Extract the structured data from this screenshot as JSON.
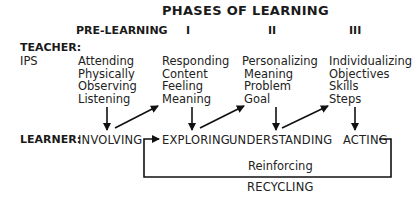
{
  "title": "PHASES OF LEARNING",
  "phases": [
    "PRE-LEARNING",
    "I",
    "II",
    "III"
  ],
  "teacher": {
    "label": "TEACHER:",
    "sublabel": "IPS",
    "columns": [
      [
        "Attending",
        "Physically",
        "Observing",
        "Listening"
      ],
      [
        "Responding",
        "Content",
        "Feeling",
        "Meaning"
      ],
      [
        "Personalizing",
        "Meaning",
        "Problem",
        "Goal"
      ],
      [
        "Individualizing",
        "Objectives",
        "Skills",
        "Steps"
      ]
    ]
  },
  "learner": {
    "label": "LEARNER:",
    "stages": [
      "INVOLVING",
      "EXPLORING",
      "UNDERSTANDING",
      "ACTING"
    ]
  },
  "loop": {
    "upper_label": "Reinforcing",
    "lower_label": "RECYCLING"
  }
}
